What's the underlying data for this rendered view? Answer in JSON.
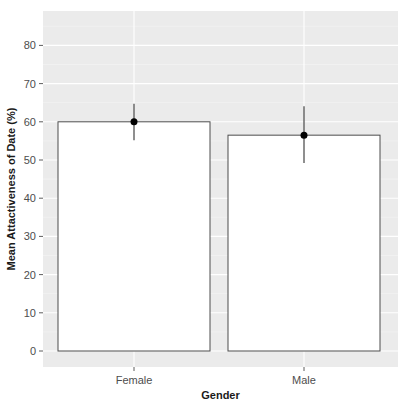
{
  "chart_data": {
    "type": "bar",
    "title": "",
    "xlabel": "Gender",
    "ylabel": "Mean Attactiveness of Date (%)",
    "categories": [
      "Female",
      "Male"
    ],
    "values": [
      60.0,
      56.5
    ],
    "error_bars": [
      {
        "low": 55.2,
        "high": 64.7
      },
      {
        "low": 49.2,
        "high": 64.1
      }
    ],
    "yticks": [
      0,
      10,
      20,
      30,
      40,
      50,
      60,
      70,
      80
    ],
    "ylim": [
      -4,
      89
    ],
    "grid": true,
    "legend": null,
    "colors": {
      "panel_bg": "#ebebeb",
      "grid": "#ffffff",
      "bar_fill": "#ffffff",
      "bar_outline": "#4d4d4d",
      "point": "#000000",
      "errorbar": "#333333"
    }
  }
}
